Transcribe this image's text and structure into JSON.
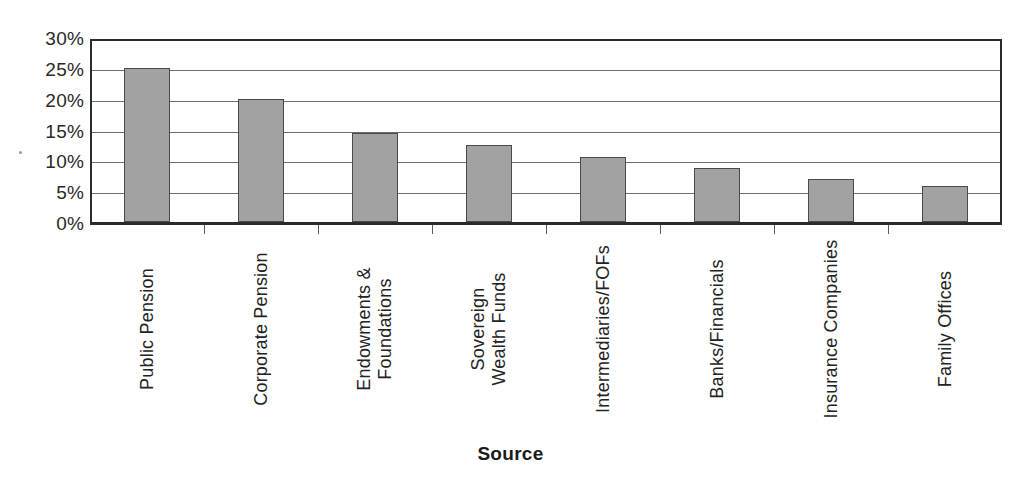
{
  "chart_data": {
    "type": "bar",
    "title": "",
    "xlabel": "Source",
    "ylabel": "",
    "categories": [
      "Public Pension",
      "Corporate Pension",
      "Endowments &\nFoundations",
      "Sovereign\nWealth Funds",
      "Intermediaries/FOFs",
      "Banks/Financials",
      "Insurance Companies",
      "Family Offices"
    ],
    "values": [
      25.0,
      20.0,
      14.5,
      12.5,
      10.5,
      8.8,
      7.0,
      5.9
    ],
    "value_unit": "%",
    "ylim": [
      0,
      30
    ],
    "ytick_labels": [
      "30%",
      "25%",
      "20%",
      "15%",
      "10%",
      "5%",
      "0%"
    ],
    "ytick_values": [
      30,
      25,
      20,
      15,
      10,
      5,
      0
    ],
    "grid": true,
    "grid_axis": "y",
    "legend": false,
    "legend_position": "none",
    "bar_color": "#a2a2a2",
    "bar_border_color": "#4a4a4a",
    "axis_color": "#2b2b2b",
    "gridline_color": "#6e6e6e",
    "background_color": "#ffffff",
    "label_rotation": -90
  },
  "axis_title": {
    "x": "Source"
  }
}
